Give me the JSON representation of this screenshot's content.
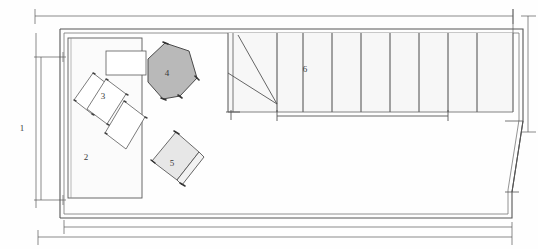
{
  "drawing": {
    "title": "Architectural floor plan sketch",
    "type": "floor-plan",
    "canvas": {
      "width": 538,
      "height": 249
    },
    "background_color": "#fefefe",
    "ink_color": "#4a4a4a",
    "fill_light": "#f4f4f4",
    "fill_medium": "#e9e9e9",
    "fill_dark": "#b9b9b9"
  },
  "labels": [
    {
      "id": "1",
      "text": "1",
      "x": 22,
      "y": 128,
      "meaning": "left-wall-dimension"
    },
    {
      "id": "2",
      "text": "2",
      "x": 86,
      "y": 157,
      "meaning": "room-area"
    },
    {
      "id": "3",
      "text": "3",
      "x": 103,
      "y": 96,
      "meaning": "furniture-group"
    },
    {
      "id": "4",
      "text": "4",
      "x": 167,
      "y": 73,
      "meaning": "shaded-polygon-object"
    },
    {
      "id": "5",
      "text": "5",
      "x": 172,
      "y": 163,
      "meaning": "shaded-square-object"
    },
    {
      "id": "6",
      "text": "6",
      "x": 305,
      "y": 69,
      "meaning": "stair-run"
    }
  ],
  "outer_wall": {
    "name": "building-envelope",
    "outer_path": "M 60,29 L 523,29 L 523,121 L 512,192 L 512,218 L 60,218 Z",
    "inner_path": "M 64,33 L 519,33 L 519,120 L 508,190 L 508,214 L 64,214 Z"
  },
  "room_2": {
    "name": "room-2",
    "x": 68,
    "y": 38,
    "width": 74,
    "height": 160,
    "fill": "#fafafa"
  },
  "furniture": {
    "top_rect": {
      "name": "furniture-rect-top",
      "x": 106,
      "y": 51,
      "width": 40,
      "height": 24
    },
    "rot_rect_a": {
      "name": "furniture-rect-a",
      "points": "74,100 93,73 111,87 92,114"
    },
    "rot_rect_b": {
      "name": "furniture-rect-b",
      "points": "87,109 106,79 126,94 107,124"
    },
    "rot_rect_c": {
      "name": "furniture-rect-c",
      "points": "105,133 124,101 145,117 126,149"
    }
  },
  "object_4": {
    "name": "polygon-object-4",
    "points": "165,43 189,51 197,78 180,96 163,99 148,82 148,59",
    "fill": "#b9b9b9"
  },
  "object_5": {
    "name": "square-object-5",
    "points": "176,132 199,152 177,180 152,161",
    "band": "199,152 203,156 181,184 177,180",
    "fill": "#e4e4e4"
  },
  "stair": {
    "name": "stair-run-6",
    "landing": {
      "x": 228,
      "y": 33,
      "width": 49,
      "height": 79
    },
    "run": {
      "x": 277,
      "y": 33,
      "width": 236,
      "height": 79
    },
    "tread_count": 8,
    "tread_x": [
      277,
      303,
      332,
      361,
      390,
      419,
      448,
      477,
      513
    ],
    "arrow_apex": {
      "x": 277,
      "y": 104
    },
    "arrow_from_a": {
      "x": 238,
      "y": 35
    },
    "arrow_from_b": {
      "x": 228,
      "y": 73
    }
  },
  "dimensions": {
    "top_outer": {
      "name": "dim-top-outer",
      "x1": 35,
      "x2": 513,
      "y": 16
    },
    "bottom_inner": {
      "name": "dim-bottom-inner",
      "x1": 64,
      "x2": 512,
      "y": 227
    },
    "bottom_outer": {
      "name": "dim-bottom-outer",
      "x1": 38,
      "x2": 512,
      "y": 237
    },
    "left_main": {
      "name": "dim-left-main",
      "y1": 57,
      "y2": 200,
      "x": 41
    },
    "right_main": {
      "name": "dim-right-main",
      "y1": 16,
      "y2": 132,
      "x": 528
    }
  }
}
